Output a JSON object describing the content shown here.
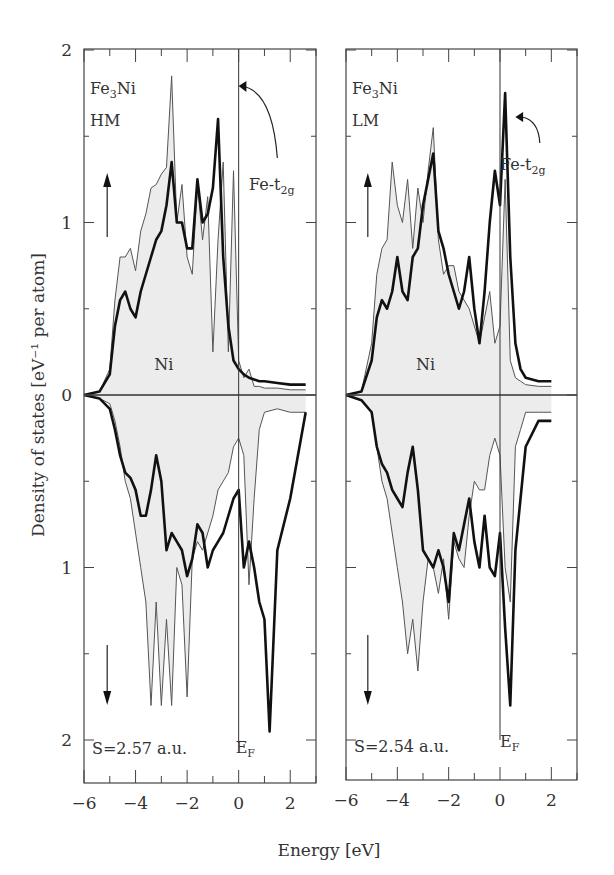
{
  "chart_data": {
    "type": "line",
    "title": "",
    "xlabel": "Energy [eV]",
    "ylabel": "Density of states [eV⁻¹ per atom]",
    "grid": false,
    "shared_ylabel": true,
    "panels": [
      {
        "id": "hm",
        "label_compound": "Fe3Ni",
        "label_state": "HM",
        "label_ni": "Ni",
        "label_fe": "Fe-t2g",
        "label_s": "S=2.57 a.u.",
        "label_ef": "EF",
        "xlim": [
          -6,
          3
        ],
        "ylim": [
          -2.25,
          2
        ],
        "xticks": [
          -6,
          -4,
          -2,
          0,
          2
        ],
        "yticks": [
          2,
          1,
          0,
          1,
          2
        ],
        "yticks_values": [
          2,
          1,
          0,
          -1,
          -2
        ],
        "series": [
          {
            "name": "Ni (shaded, spin-up)",
            "style": "thin-filled",
            "x": [
              -6,
              -5.4,
              -5.0,
              -4.8,
              -4.6,
              -4.4,
              -4.2,
              -4.0,
              -3.8,
              -3.6,
              -3.4,
              -3.2,
              -3.0,
              -2.8,
              -2.6,
              -2.4,
              -2.2,
              -2.0,
              -1.8,
              -1.6,
              -1.4,
              -1.2,
              -1.0,
              -0.8,
              -0.6,
              -0.4,
              -0.2,
              0.0,
              0.2,
              0.4,
              0.6,
              0.8,
              1.0,
              1.5,
              2.0,
              2.6
            ],
            "y": [
              0,
              0.02,
              0.15,
              0.55,
              0.8,
              0.8,
              0.85,
              0.72,
              0.95,
              1.05,
              1.2,
              1.22,
              1.28,
              1.32,
              1.85,
              1.0,
              1.22,
              0.8,
              0.7,
              1.22,
              0.9,
              1.15,
              0.25,
              0.9,
              1.35,
              0.25,
              1.3,
              0.2,
              0.1,
              0.15,
              0.05,
              0.05,
              0.04,
              0.04,
              0.03,
              0.03
            ]
          },
          {
            "name": "Fe (thick, spin-up)",
            "style": "thick",
            "x": [
              -6,
              -5.4,
              -5.0,
              -4.8,
              -4.6,
              -4.4,
              -4.2,
              -4.0,
              -3.8,
              -3.6,
              -3.4,
              -3.2,
              -3.0,
              -2.8,
              -2.6,
              -2.4,
              -2.2,
              -2.0,
              -1.8,
              -1.6,
              -1.4,
              -1.2,
              -1.0,
              -0.8,
              -0.6,
              -0.4,
              -0.2,
              0.0,
              0.2,
              0.4,
              0.6,
              0.8,
              1.0,
              1.5,
              2.0,
              2.6
            ],
            "y": [
              0,
              0.02,
              0.12,
              0.4,
              0.55,
              0.6,
              0.5,
              0.45,
              0.6,
              0.7,
              0.8,
              0.9,
              0.95,
              1.1,
              1.35,
              1.0,
              1.0,
              0.85,
              0.85,
              1.25,
              1.0,
              1.05,
              1.2,
              1.6,
              0.8,
              0.4,
              0.2,
              0.15,
              0.12,
              0.1,
              0.09,
              0.08,
              0.08,
              0.07,
              0.06,
              0.06
            ]
          },
          {
            "name": "Ni (shaded, spin-down)",
            "style": "thin-filled",
            "x": [
              -6,
              -5.4,
              -5.0,
              -4.8,
              -4.6,
              -4.4,
              -4.2,
              -4.0,
              -3.8,
              -3.6,
              -3.4,
              -3.2,
              -3.0,
              -2.8,
              -2.6,
              -2.4,
              -2.2,
              -2.0,
              -1.8,
              -1.6,
              -1.4,
              -1.2,
              -1.0,
              -0.8,
              -0.6,
              -0.4,
              -0.2,
              0.0,
              0.2,
              0.4,
              0.6,
              0.8,
              1.0,
              1.5,
              2.0,
              2.6
            ],
            "y": [
              0,
              -0.02,
              -0.05,
              -0.15,
              -0.3,
              -0.5,
              -0.6,
              -0.8,
              -1.0,
              -1.2,
              -1.8,
              -1.2,
              -1.8,
              -1.3,
              -1.8,
              -1.0,
              -1.1,
              -1.75,
              -0.95,
              -0.85,
              -0.9,
              -0.8,
              -0.7,
              -0.55,
              -0.5,
              -0.45,
              -0.3,
              -0.25,
              -0.35,
              -1.1,
              -0.6,
              -0.2,
              -0.1,
              -0.08,
              -0.1,
              -0.1
            ]
          },
          {
            "name": "Fe (thick, spin-down)",
            "style": "thick",
            "x": [
              -6,
              -5.4,
              -5.0,
              -4.8,
              -4.6,
              -4.4,
              -4.2,
              -4.0,
              -3.8,
              -3.6,
              -3.4,
              -3.2,
              -3.0,
              -2.8,
              -2.6,
              -2.4,
              -2.2,
              -2.0,
              -1.8,
              -1.6,
              -1.4,
              -1.2,
              -1.0,
              -0.8,
              -0.6,
              -0.4,
              -0.2,
              0.0,
              0.2,
              0.4,
              0.6,
              0.8,
              1.0,
              1.2,
              1.5,
              2.0,
              2.6
            ],
            "y": [
              0,
              -0.02,
              -0.08,
              -0.2,
              -0.35,
              -0.45,
              -0.48,
              -0.55,
              -0.7,
              -0.7,
              -0.55,
              -0.35,
              -0.5,
              -0.9,
              -0.8,
              -0.85,
              -0.9,
              -1.05,
              -0.95,
              -0.75,
              -0.8,
              -1.0,
              -0.9,
              -0.85,
              -0.8,
              -0.7,
              -0.6,
              -0.55,
              -1.0,
              -0.85,
              -1.0,
              -1.2,
              -1.3,
              -1.95,
              -0.9,
              -0.6,
              -0.1
            ]
          }
        ]
      },
      {
        "id": "lm",
        "label_compound": "Fe3Ni",
        "label_state": "LM",
        "label_ni": "Ni",
        "label_fe": "Fe-t2g",
        "label_s": "S=2.54 a.u.",
        "label_ef": "EF",
        "xlim": [
          -6,
          3
        ],
        "ylim": [
          -2.25,
          2
        ],
        "xticks": [
          -6,
          -4,
          -2,
          0,
          2
        ],
        "yticks": [
          2,
          1,
          0,
          1,
          2
        ],
        "yticks_values": [
          2,
          1,
          0,
          -1,
          -2
        ],
        "series": [
          {
            "name": "Ni (shaded, spin-up)",
            "style": "thin-filled",
            "x": [
              -6,
              -5.4,
              -5.0,
              -4.8,
              -4.6,
              -4.4,
              -4.2,
              -4.0,
              -3.8,
              -3.6,
              -3.4,
              -3.2,
              -3.0,
              -2.8,
              -2.6,
              -2.4,
              -2.2,
              -2.0,
              -1.8,
              -1.6,
              -1.4,
              -1.2,
              -1.0,
              -0.8,
              -0.6,
              -0.4,
              -0.2,
              0.0,
              0.2,
              0.4,
              0.6,
              0.8,
              1.0,
              1.5,
              2.0
            ],
            "y": [
              0,
              0.02,
              0.3,
              0.7,
              0.85,
              0.9,
              1.35,
              1.1,
              1.0,
              1.25,
              0.85,
              1.2,
              1.0,
              1.3,
              1.55,
              0.9,
              0.7,
              0.75,
              0.75,
              0.6,
              0.55,
              0.5,
              0.4,
              0.3,
              0.45,
              0.6,
              0.3,
              0.4,
              1.25,
              0.2,
              0.1,
              0.08,
              0.06,
              0.05,
              0.05
            ]
          },
          {
            "name": "Fe (thick, spin-up)",
            "style": "thick",
            "x": [
              -6,
              -5.4,
              -5.0,
              -4.8,
              -4.6,
              -4.4,
              -4.2,
              -4.0,
              -3.8,
              -3.6,
              -3.4,
              -3.2,
              -3.0,
              -2.8,
              -2.6,
              -2.4,
              -2.2,
              -2.0,
              -1.8,
              -1.6,
              -1.4,
              -1.2,
              -1.0,
              -0.8,
              -0.6,
              -0.4,
              -0.2,
              0.0,
              0.2,
              0.4,
              0.6,
              0.8,
              1.0,
              1.5,
              2.0
            ],
            "y": [
              0,
              0.02,
              0.2,
              0.45,
              0.55,
              0.5,
              0.6,
              0.8,
              0.6,
              0.55,
              0.8,
              0.85,
              1.1,
              1.25,
              1.4,
              0.95,
              0.85,
              0.7,
              0.6,
              0.5,
              0.6,
              0.8,
              0.5,
              0.3,
              0.6,
              1.0,
              1.3,
              1.1,
              1.75,
              0.8,
              0.3,
              0.15,
              0.1,
              0.08,
              0.08
            ]
          },
          {
            "name": "Ni (shaded, spin-down)",
            "style": "thin-filled",
            "x": [
              -6,
              -5.4,
              -5.0,
              -4.8,
              -4.6,
              -4.4,
              -4.2,
              -4.0,
              -3.8,
              -3.6,
              -3.4,
              -3.2,
              -3.0,
              -2.8,
              -2.6,
              -2.4,
              -2.2,
              -2.0,
              -1.8,
              -1.6,
              -1.4,
              -1.2,
              -1.0,
              -0.8,
              -0.6,
              -0.4,
              -0.2,
              0.0,
              0.2,
              0.4,
              0.6,
              0.8,
              1.0,
              1.5,
              2.0
            ],
            "y": [
              0,
              -0.03,
              -0.1,
              -0.3,
              -0.5,
              -0.6,
              -0.8,
              -1.0,
              -1.2,
              -1.5,
              -1.3,
              -1.6,
              -1.2,
              -0.95,
              -1.0,
              -1.15,
              -0.95,
              -1.3,
              -0.85,
              -0.95,
              -1.0,
              -0.7,
              -0.5,
              -0.55,
              -0.55,
              -0.35,
              -0.25,
              -0.35,
              -1.0,
              -1.2,
              -0.3,
              -0.2,
              -0.1,
              -0.1,
              -0.1
            ]
          },
          {
            "name": "Fe (thick, spin-down)",
            "style": "thick",
            "x": [
              -6,
              -5.4,
              -5.0,
              -4.8,
              -4.6,
              -4.4,
              -4.2,
              -4.0,
              -3.8,
              -3.6,
              -3.4,
              -3.2,
              -3.0,
              -2.8,
              -2.6,
              -2.4,
              -2.2,
              -2.0,
              -1.8,
              -1.6,
              -1.4,
              -1.2,
              -1.0,
              -0.8,
              -0.6,
              -0.4,
              -0.2,
              0.0,
              0.2,
              0.4,
              0.6,
              0.8,
              1.0,
              1.5,
              2.0
            ],
            "y": [
              0,
              -0.03,
              -0.1,
              -0.3,
              -0.4,
              -0.45,
              -0.55,
              -0.6,
              -0.65,
              -0.45,
              -0.3,
              -0.55,
              -0.9,
              -0.95,
              -1.0,
              -0.9,
              -1.0,
              -1.2,
              -0.8,
              -0.9,
              -0.75,
              -0.6,
              -0.85,
              -1.0,
              -0.7,
              -1.0,
              -1.05,
              -0.8,
              -1.35,
              -1.8,
              -0.9,
              -0.6,
              -0.3,
              -0.15,
              -0.15
            ]
          }
        ]
      }
    ]
  }
}
